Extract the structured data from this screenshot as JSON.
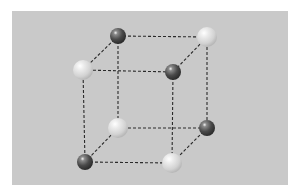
{
  "diagram": {
    "background_color": "#c9c9c9",
    "edge_color": "#2a2a2a",
    "edge_style": "dashed",
    "colors": {
      "dark_sphere": "#4a4a4a",
      "light_sphere": "#e2e2e2"
    },
    "nodes": [
      {
        "id": "back-top-left",
        "type": "dark",
        "x": 118,
        "y": 36,
        "r": 8
      },
      {
        "id": "back-top-right",
        "type": "light",
        "x": 207,
        "y": 37,
        "r": 10
      },
      {
        "id": "front-top-left",
        "type": "light",
        "x": 83,
        "y": 70,
        "r": 10
      },
      {
        "id": "front-top-right",
        "type": "dark",
        "x": 173,
        "y": 72,
        "r": 8
      },
      {
        "id": "back-bottom-left",
        "type": "light",
        "x": 118,
        "y": 128,
        "r": 10
      },
      {
        "id": "back-bottom-right",
        "type": "dark",
        "x": 207,
        "y": 128,
        "r": 8
      },
      {
        "id": "front-bottom-left",
        "type": "dark",
        "x": 85,
        "y": 162,
        "r": 8
      },
      {
        "id": "front-bottom-right",
        "type": "light",
        "x": 172,
        "y": 163,
        "r": 10
      }
    ],
    "edges": [
      [
        "back-top-left",
        "back-top-right"
      ],
      [
        "front-top-left",
        "front-top-right"
      ],
      [
        "back-top-left",
        "front-top-left"
      ],
      [
        "back-top-right",
        "front-top-right"
      ],
      [
        "back-bottom-left",
        "back-bottom-right"
      ],
      [
        "front-bottom-left",
        "front-bottom-right"
      ],
      [
        "back-bottom-left",
        "front-bottom-left"
      ],
      [
        "back-bottom-right",
        "front-bottom-right"
      ],
      [
        "back-top-left",
        "back-bottom-left"
      ],
      [
        "back-top-right",
        "back-bottom-right"
      ],
      [
        "front-top-left",
        "front-bottom-left"
      ],
      [
        "front-top-right",
        "front-bottom-right"
      ]
    ]
  }
}
